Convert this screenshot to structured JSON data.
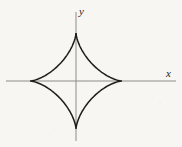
{
  "figure": {
    "background_color": "#f7f6f3",
    "width": 182,
    "height": 147
  },
  "axes": {
    "x_axis": {
      "label": "x",
      "color": "#8e8c8a",
      "stroke_width": 1,
      "y_pixel": 81,
      "x_start_pixel": 6,
      "x_end_pixel": 176
    },
    "y_axis": {
      "label": "y",
      "color": "#8e8c8a",
      "stroke_width": 1,
      "x_pixel": 76,
      "y_start_pixel": 12,
      "y_end_pixel": 141
    },
    "origin": {
      "x": 76,
      "y": 81
    }
  },
  "chart_data": {
    "type": "line",
    "title": "",
    "xlabel": "x",
    "ylabel": "y",
    "curve_name": "astroid",
    "equation": "x^(2/3) + y^(2/3) = a^(2/3)",
    "parametric": "x = a cos^3(t),  y = a sin^3(t)",
    "center": [
      0,
      0
    ],
    "semi_axis_x": 46,
    "semi_axis_y": 48,
    "cusps": [
      {
        "name": "right-cusp",
        "x": 46,
        "y": 0,
        "px": [
          122,
          81
        ]
      },
      {
        "name": "top-cusp",
        "x": 0,
        "y": 48,
        "px": [
          76,
          33
        ]
      },
      {
        "name": "left-cusp",
        "x": -46,
        "y": 0,
        "px": [
          30,
          81
        ]
      },
      {
        "name": "bottom-cusp",
        "x": 0,
        "y": -48,
        "px": [
          76,
          129
        ]
      }
    ],
    "series": [
      {
        "name": "astroid",
        "color": "#1f1d1c",
        "stroke_width": 1.5,
        "closed": true,
        "x": [
          46,
          44.1,
          38.7,
          30.8,
          21.6,
          12.4,
          5.0,
          0.6,
          0,
          0.6,
          5.0,
          12.4,
          21.6,
          30.8,
          38.7,
          44.1,
          46,
          44.1,
          38.7,
          30.8,
          21.6,
          12.4,
          5.0,
          0.6,
          0,
          -0.6,
          -5.0,
          -12.4,
          -21.6,
          -30.8,
          -38.7,
          -44.1,
          -46
        ],
        "y": [
          0,
          0.6,
          5.2,
          13.0,
          22.5,
          32.3,
          41.0,
          47.3,
          48,
          47.3,
          41.0,
          32.3,
          22.5,
          13.0,
          5.2,
          0.6,
          0,
          -0.6,
          -5.2,
          -13.0,
          -22.5,
          -32.3,
          -41.0,
          -47.3,
          -48,
          -47.3,
          -41.0,
          -32.3,
          -22.5,
          -13.0,
          -5.2,
          -0.6,
          0
        ]
      }
    ],
    "xlim": [
      -70,
      100
    ],
    "ylim": [
      -60,
      69
    ],
    "grid": false,
    "legend": null
  }
}
